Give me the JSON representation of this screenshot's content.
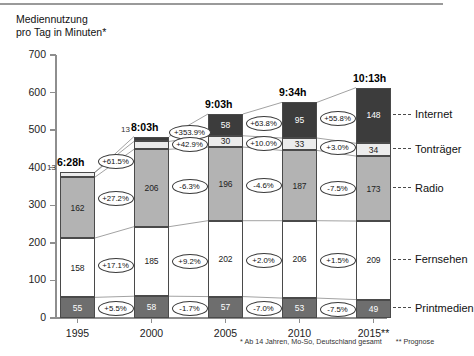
{
  "title": "Mediennutzung\npro Tag in Minuten*",
  "title_line1": "Mediennutzung",
  "title_line2": "pro Tag in Minuten*",
  "footnote_main": "* Ab 14 Jahren, Mo-So, Deutschland gesamt",
  "footnote_forecast": "** Prognose",
  "legend": [
    {
      "key": "internet",
      "label": "Internet"
    },
    {
      "key": "tontraeger",
      "label": "Tonträger"
    },
    {
      "key": "radio",
      "label": "Radio"
    },
    {
      "key": "fernsehen",
      "label": "Fernsehen"
    },
    {
      "key": "printmedien",
      "label": "Printmedien"
    }
  ],
  "totals": [
    {
      "year": "1995",
      "label": "6:28h",
      "minutes": 388
    },
    {
      "year": "2000",
      "label": "8:03h",
      "minutes": 483
    },
    {
      "year": "2005",
      "label": "9:03h",
      "minutes": 543
    },
    {
      "year": "2010",
      "label": "9:34h",
      "minutes": 574
    },
    {
      "year": "2015**",
      "label": "10:13h",
      "minutes": 613
    }
  ],
  "outside_values": [
    {
      "year": "1995",
      "series": "Tonträger",
      "value": "13"
    },
    {
      "year": "2000",
      "series": "Internet",
      "value": "13"
    }
  ],
  "growth": {
    "1995_2000": [
      {
        "series": "Tonträger",
        "value": "+61.5%"
      },
      {
        "series": "Radio",
        "value": "+27.2%"
      },
      {
        "series": "Fernsehen",
        "value": "+17.1%"
      },
      {
        "series": "Printmedien",
        "value": "+5.5%"
      }
    ],
    "2000_2005": [
      {
        "series": "Internet",
        "value": "+353.9%"
      },
      {
        "series": "Tonträger",
        "value": "+42.9%"
      },
      {
        "series": "Radio",
        "value": "-6.3%"
      },
      {
        "series": "Fernsehen",
        "value": "+9.2%"
      },
      {
        "series": "Printmedien",
        "value": "-1.7%"
      }
    ],
    "2005_2010": [
      {
        "series": "Internet",
        "value": "+63.8%"
      },
      {
        "series": "Tonträger",
        "value": "+10.0%"
      },
      {
        "series": "Radio",
        "value": "-4.6%"
      },
      {
        "series": "Fernsehen",
        "value": "+2.0%"
      },
      {
        "series": "Printmedien",
        "value": "-7.0%"
      }
    ],
    "2010_2015": [
      {
        "series": "Internet",
        "value": "+55.8%"
      },
      {
        "series": "Tonträger",
        "value": "+3.0%"
      },
      {
        "series": "Radio",
        "value": "-7.5%"
      },
      {
        "series": "Fernsehen",
        "value": "+1.5%"
      },
      {
        "series": "Printmedien",
        "value": "-7.5%"
      }
    ]
  },
  "chart_data": {
    "type": "bar",
    "subtype": "stacked-bar",
    "title": "Mediennutzung pro Tag in Minuten*",
    "xlabel": "",
    "ylabel": "Minuten",
    "categories": [
      "1995",
      "2000",
      "2005",
      "2010",
      "2015**"
    ],
    "ylim": [
      0,
      700
    ],
    "yticks": [
      0,
      100,
      200,
      300,
      400,
      500,
      600,
      700
    ],
    "grid": false,
    "legend_position": "right",
    "stack_order_bottom_to_top": [
      "Printmedien",
      "Fernsehen",
      "Radio",
      "Tonträger",
      "Internet"
    ],
    "series": [
      {
        "name": "Printmedien",
        "color": "#6e6e6e",
        "values": [
          55,
          58,
          57,
          53,
          49
        ]
      },
      {
        "name": "Fernsehen",
        "color": "#ffffff",
        "values": [
          158,
          185,
          202,
          206,
          209
        ]
      },
      {
        "name": "Radio",
        "color": "#b3b3b3",
        "values": [
          162,
          206,
          196,
          187,
          173
        ]
      },
      {
        "name": "Tonträger",
        "color": "#ececec",
        "values": [
          13,
          21,
          30,
          33,
          34
        ]
      },
      {
        "name": "Internet",
        "color": "#3c3c3c",
        "values": [
          0,
          13,
          58,
          95,
          148
        ]
      }
    ],
    "totals_minutes": [
      388,
      483,
      543,
      574,
      613
    ],
    "totals_labels": [
      "6:28h",
      "8:03h",
      "9:03h",
      "9:34h",
      "10:13h"
    ],
    "annotations": {
      "growth_percent_between_periods": {
        "1995-2000": {
          "Tonträger": "+61.5%",
          "Radio": "+27.2%",
          "Fernsehen": "+17.1%",
          "Printmedien": "+5.5%"
        },
        "2000-2005": {
          "Internet": "+353.9%",
          "Tonträger": "+42.9%",
          "Radio": "-6.3%",
          "Fernsehen": "+9.2%",
          "Printmedien": "-1.7%"
        },
        "2005-2010": {
          "Internet": "+63.8%",
          "Tonträger": "+10.0%",
          "Radio": "-4.6%",
          "Fernsehen": "+2.0%",
          "Printmedien": "-7.0%"
        },
        "2010-2015": {
          "Internet": "+55.8%",
          "Tonträger": "+3.0%",
          "Radio": "-7.5%",
          "Fernsehen": "+1.5%",
          "Printmedien": "-7.5%"
        }
      },
      "footnotes": [
        "* Ab 14 Jahren, Mo-So, Deutschland gesamt",
        "** Prognose"
      ]
    }
  }
}
